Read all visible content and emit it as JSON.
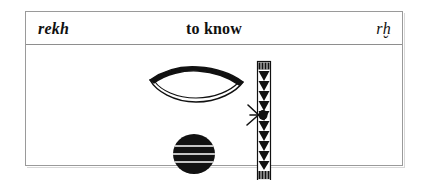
{
  "card": {
    "header": {
      "transliteration_english": "rekh",
      "meaning": "to know",
      "transliteration_egyptological": "rḫ"
    },
    "hieroglyphs": [
      {
        "name": "mouth-glyph",
        "gardiner_sign": "D21",
        "phonetic_value": "r",
        "description": "horizontal lens / rhombus outline with thick black upper edge"
      },
      {
        "name": "placenta-disc-glyph",
        "gardiner_sign": "Aa1",
        "phonetic_value": "ḫ",
        "description": "solid black circle with thin horizontal white stripes"
      },
      {
        "name": "folded-cloth-strip-glyph",
        "gardiner_sign": "Y1",
        "phonetic_value": "determinative",
        "description": "tall narrow vertical strip with triangular zigzag fill, hatched caps, crossed diagonal sticks at mid-height"
      }
    ]
  },
  "colors": {
    "ink": "#111111",
    "frame": "#9a9a9a",
    "rule": "#8e8e8e",
    "paper": "#ffffff"
  }
}
